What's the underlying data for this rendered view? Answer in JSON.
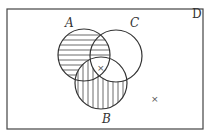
{
  "diagram": {
    "type": "venn",
    "universe_label": "D",
    "sets": [
      {
        "name": "A",
        "label": "A",
        "cx": 84,
        "cy": 55,
        "r": 26,
        "label_x": 69,
        "label_y": 27
      },
      {
        "name": "C",
        "label": "C",
        "cx": 116,
        "cy": 56,
        "r": 26,
        "label_x": 134,
        "label_y": 27
      },
      {
        "name": "B",
        "label": "B",
        "cx": 101,
        "cy": 83,
        "r": 26,
        "label_x": 106,
        "label_y": 122
      }
    ],
    "shading": {
      "horizontal_lines": "A minus B",
      "vertical_lines": "B minus C"
    },
    "marks": [
      {
        "symbol": "×",
        "x": 100,
        "y": 70,
        "region": "A ∩ B ∩ C"
      },
      {
        "symbol": "×",
        "x": 154,
        "y": 101,
        "region": "outside all sets"
      }
    ],
    "colors": {
      "stroke": "#333333",
      "background": "#ffffff"
    }
  }
}
